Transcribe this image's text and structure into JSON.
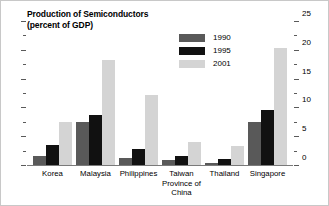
{
  "chart_data": {
    "type": "bar",
    "title": "Production of Semiconductors",
    "subtitle": "(percent of GDP)",
    "xlabel": "",
    "ylabel": "",
    "ylim": [
      0,
      25
    ],
    "yticks": [
      0,
      5,
      10,
      15,
      20,
      25
    ],
    "ytick_labels": [
      "0",
      "5",
      "10",
      "15",
      "20",
      "25"
    ],
    "minor_tick_step": 2.5,
    "grid": false,
    "axis_position": "right",
    "legend_position": "upper-center",
    "categories": [
      "Korea",
      "Malaysia",
      "Philippines",
      "Taiwan Province of China",
      "Thailand",
      "Singapore"
    ],
    "category_lines": [
      [
        "Korea"
      ],
      [
        "Malaysia"
      ],
      [
        "Philippines"
      ],
      [
        "Taiwan",
        "Province of",
        "China"
      ],
      [
        "Thailand"
      ],
      [
        "Singapore"
      ]
    ],
    "series": [
      {
        "name": "1990",
        "color": "#595959",
        "values": [
          1.5,
          7.4,
          1.2,
          0.9,
          0.3,
          7.5
        ]
      },
      {
        "name": "1995",
        "color": "#111111",
        "values": [
          3.5,
          8.6,
          2.7,
          1.5,
          1.0,
          9.6
        ]
      },
      {
        "name": "2001",
        "color": "#d4d4d4",
        "values": [
          7.5,
          18.2,
          12.1,
          4.0,
          3.3,
          20.4
        ]
      }
    ]
  },
  "colors": {
    "series_1990": "#595959",
    "series_1995": "#111111",
    "series_2001": "#d4d4d4",
    "axis": "#5a5a5a",
    "baseline": "#7a7a7a",
    "border": "#c8c8c8",
    "text": "#000000"
  }
}
